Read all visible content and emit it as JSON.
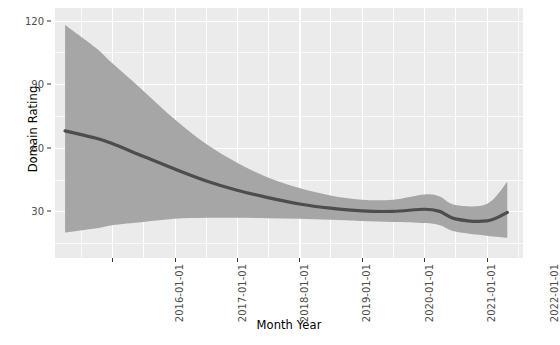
{
  "chart_data": {
    "type": "line",
    "title": "",
    "xlabel": "Month Year",
    "ylabel": "Domain Rating",
    "grid": true,
    "legend": "none",
    "style": "ggplot2-grey-panel",
    "colors": {
      "panel_background": "#EBEBEB",
      "gridline": "#FFFFFF",
      "ribbon": "#A6A6A6",
      "line": "#4D4D4D",
      "text": "#000000",
      "tick_text": "#4D4D4D",
      "page_background": "#FFFFFF"
    },
    "y_axis": {
      "ticks": [
        30,
        60,
        90,
        120
      ],
      "tick_labels": [
        "30",
        "60",
        "90",
        "120"
      ],
      "minor_ticks": [
        15,
        45,
        75,
        105
      ],
      "ylim": [
        8,
        126
      ]
    },
    "x_axis": {
      "ticks": [
        "2016-01-01",
        "2017-01-01",
        "2018-01-01",
        "2019-01-01",
        "2020-01-01",
        "2021-01-01",
        "2022-01-01"
      ],
      "tick_labels": [
        "2016-01-01",
        "2017-01-01",
        "2018-01-01",
        "2019-01-01",
        "2020-01-01",
        "2021-01-01",
        "2022-01-01"
      ],
      "label_rotation_degrees": -90,
      "xlim": [
        "2015-02-01",
        "2022-08-01"
      ]
    },
    "series": [
      {
        "name": "Domain Rating (smoothed)",
        "type": "line-with-confidence-band",
        "x": [
          "2015-04-01",
          "2015-10-01",
          "2016-01-01",
          "2016-07-01",
          "2017-01-01",
          "2017-07-01",
          "2018-01-01",
          "2018-07-01",
          "2019-01-01",
          "2019-07-01",
          "2020-01-01",
          "2020-07-01",
          "2021-01-01",
          "2021-04-01",
          "2021-07-01",
          "2022-01-01",
          "2022-05-01"
        ],
        "values": [
          68.0,
          64.5,
          62.0,
          56.0,
          50.0,
          44.5,
          40.0,
          36.5,
          33.5,
          31.5,
          30.2,
          30.0,
          31.0,
          30.0,
          26.5,
          25.5,
          29.5
        ],
        "ci_lower": [
          20.0,
          22.0,
          23.5,
          25.0,
          26.5,
          27.0,
          27.0,
          26.8,
          26.5,
          26.0,
          25.5,
          25.0,
          24.5,
          23.5,
          20.5,
          18.5,
          17.5
        ],
        "ci_upper": [
          118.0,
          107.0,
          100.0,
          87.0,
          73.5,
          62.0,
          53.0,
          46.0,
          41.0,
          37.5,
          35.5,
          35.5,
          38.0,
          37.0,
          33.0,
          33.5,
          44.0
        ]
      }
    ]
  }
}
